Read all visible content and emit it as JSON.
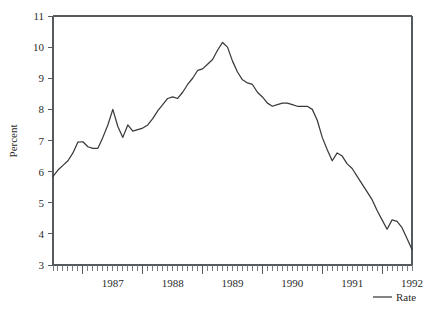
{
  "chart_data": {
    "type": "line",
    "title": "",
    "subtitle": "",
    "xlabel": "",
    "ylabel": "Percent",
    "ylim": [
      3,
      11
    ],
    "xlim": [
      "1986-07",
      "1992-07"
    ],
    "grid": false,
    "legend_position": "bottom-right",
    "y_ticks": [
      3,
      4,
      5,
      6,
      7,
      8,
      9,
      10,
      11
    ],
    "y_tick_labels": [
      "3",
      "4",
      "5",
      "6",
      "7",
      "8",
      "9",
      "10",
      "11"
    ],
    "x_tick_labels": [
      "1987",
      "1988",
      "1989",
      "1990",
      "1991",
      "1992"
    ],
    "x_minor_tick_interval": "month",
    "series": [
      {
        "name": "Rate",
        "color": "#3a3a3a",
        "x": [
          "1986-07",
          "1986-08",
          "1986-09",
          "1986-10",
          "1986-11",
          "1986-12",
          "1987-01",
          "1987-02",
          "1987-03",
          "1987-04",
          "1987-05",
          "1987-06",
          "1987-07",
          "1987-08",
          "1987-09",
          "1987-10",
          "1987-11",
          "1987-12",
          "1988-01",
          "1988-02",
          "1988-03",
          "1988-04",
          "1988-05",
          "1988-06",
          "1988-07",
          "1988-08",
          "1988-09",
          "1988-10",
          "1988-11",
          "1988-12",
          "1989-01",
          "1989-02",
          "1989-03",
          "1989-04",
          "1989-05",
          "1989-06",
          "1989-07",
          "1989-08",
          "1989-09",
          "1989-10",
          "1989-11",
          "1989-12",
          "1990-01",
          "1990-02",
          "1990-03",
          "1990-04",
          "1990-05",
          "1990-06",
          "1990-07",
          "1990-08",
          "1990-09",
          "1990-10",
          "1990-11",
          "1990-12",
          "1991-01",
          "1991-02",
          "1991-03",
          "1991-04",
          "1991-05",
          "1991-06",
          "1991-07",
          "1991-08",
          "1991-09",
          "1991-10",
          "1991-11",
          "1991-12",
          "1992-01",
          "1992-02",
          "1992-03",
          "1992-04",
          "1992-05",
          "1992-06",
          "1992-07"
        ],
        "values": [
          5.85,
          6.05,
          6.2,
          6.35,
          6.6,
          6.95,
          6.96,
          6.8,
          6.75,
          6.75,
          7.1,
          7.5,
          8.0,
          7.45,
          7.1,
          7.5,
          7.3,
          7.35,
          7.4,
          7.5,
          7.7,
          7.95,
          8.15,
          8.35,
          8.4,
          8.35,
          8.55,
          8.8,
          9.0,
          9.25,
          9.3,
          9.45,
          9.6,
          9.9,
          10.15,
          10.0,
          9.55,
          9.2,
          8.95,
          8.85,
          8.8,
          8.55,
          8.4,
          8.2,
          8.1,
          8.15,
          8.2,
          8.2,
          8.15,
          8.1,
          8.1,
          8.1,
          8.0,
          7.65,
          7.1,
          6.7,
          6.35,
          6.6,
          6.5,
          6.25,
          6.1,
          5.85,
          5.6,
          5.35,
          5.1,
          4.75,
          4.45,
          4.15,
          4.45,
          4.4,
          4.2,
          3.85,
          3.5
        ]
      }
    ]
  },
  "legend": {
    "entries": [
      {
        "label": "Rate"
      }
    ]
  },
  "axes": {
    "y_title": "Percent"
  }
}
